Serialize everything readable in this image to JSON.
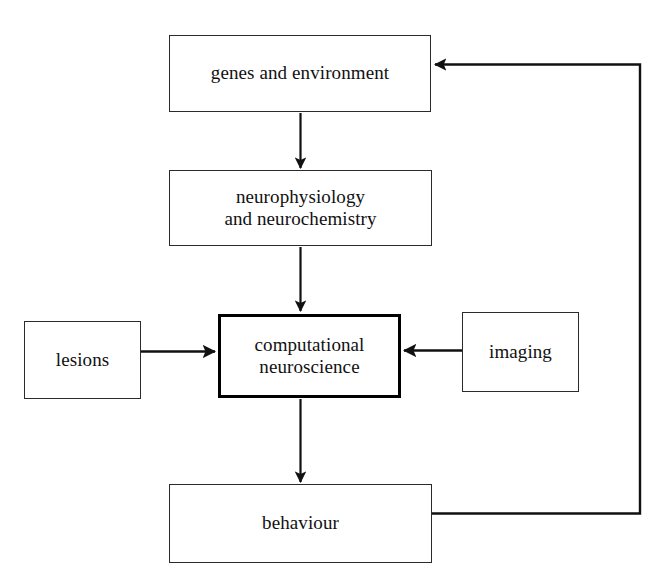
{
  "diagram": {
    "type": "flow-diagram",
    "background_color": "#ffffff",
    "stroke_color": "#222222",
    "emphasis_stroke_color": "#000000",
    "nodes": [
      {
        "id": "genes",
        "label": "genes and environment",
        "emphasis": false
      },
      {
        "id": "neurophys",
        "label": "neurophysiology\nand neurochemistry",
        "emphasis": false
      },
      {
        "id": "compneuro",
        "label": "computational\nneuroscience",
        "emphasis": true
      },
      {
        "id": "lesions",
        "label": "lesions",
        "emphasis": false
      },
      {
        "id": "imaging",
        "label": "imaging",
        "emphasis": false
      },
      {
        "id": "behaviour",
        "label": "behaviour",
        "emphasis": false
      }
    ],
    "edges": [
      {
        "id": "genes-to-neurophys",
        "from": "genes",
        "to": "neurophys",
        "direction": "down",
        "routing": "straight"
      },
      {
        "id": "neurophys-to-compneuro",
        "from": "neurophys",
        "to": "compneuro",
        "direction": "down",
        "routing": "straight"
      },
      {
        "id": "lesions-to-compneuro",
        "from": "lesions",
        "to": "compneuro",
        "direction": "right",
        "routing": "straight"
      },
      {
        "id": "imaging-to-compneuro",
        "from": "imaging",
        "to": "compneuro",
        "direction": "left",
        "routing": "straight"
      },
      {
        "id": "compneuro-to-behaviour",
        "from": "compneuro",
        "to": "behaviour",
        "direction": "down",
        "routing": "straight"
      },
      {
        "id": "behaviour-to-genes",
        "from": "behaviour",
        "to": "genes",
        "direction": "left",
        "routing": "orthogonal-feedback-loop"
      }
    ]
  }
}
